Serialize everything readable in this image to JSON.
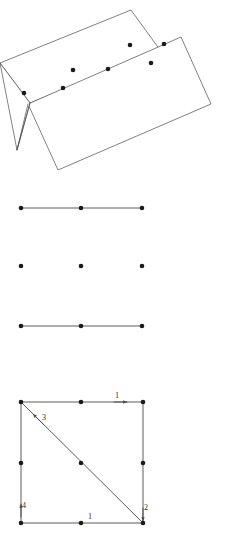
{
  "page": {
    "background_color": "#ffffff",
    "width": 228,
    "height": 551,
    "stroke_color": "#4a4a4a",
    "dot_color": "#1a1a1a",
    "label_color": "#2b2b2b"
  },
  "figures": [
    {
      "id": "folded-sheet-figure",
      "name": "folded-sheet-figure",
      "description": "Two overlapping tilted quadrilaterals forming a folded sheet, with seven marker dots",
      "polygons": [
        {
          "name": "upper-sheet-panel",
          "points": "0,63 131,10 160,50 30,103"
        },
        {
          "name": "lower-sheet-panel",
          "points": "28,104 181,37 211,104 58,170"
        },
        {
          "name": "fold-crease-panel",
          "points": "30,103 17,150 0,63"
        }
      ],
      "creases": [
        {
          "name": "fold-crease-left",
          "x1": 30,
          "y1": 103,
          "x2": 17,
          "y2": 150
        },
        {
          "name": "fold-crease-right",
          "x1": 17,
          "y1": 150,
          "x2": 28,
          "y2": 104
        }
      ],
      "dots": [
        {
          "name": "sheet-dot-1",
          "cx": 24,
          "cy": 93
        },
        {
          "name": "sheet-dot-2",
          "cx": 63,
          "cy": 88
        },
        {
          "name": "sheet-dot-3",
          "cx": 73,
          "cy": 70
        },
        {
          "name": "sheet-dot-4",
          "cx": 108,
          "cy": 69
        },
        {
          "name": "sheet-dot-5",
          "cx": 130,
          "cy": 45
        },
        {
          "name": "sheet-dot-6",
          "cx": 164,
          "cy": 44
        },
        {
          "name": "sheet-dot-7",
          "cx": 151,
          "cy": 63
        }
      ]
    },
    {
      "id": "dot-grid-figure",
      "name": "dot-grid-figure",
      "description": "Three-by-three grid of dots with horizontal connecting lines on the top and bottom rows only",
      "lines": [
        {
          "name": "grid-line-top",
          "x1": 21,
          "y1": 208,
          "x2": 142,
          "y2": 208
        },
        {
          "name": "grid-line-bottom",
          "x1": 21,
          "y1": 326,
          "x2": 142,
          "y2": 326
        }
      ],
      "dots": [
        {
          "name": "grid-dot-top-left",
          "cx": 21,
          "cy": 208
        },
        {
          "name": "grid-dot-top-center",
          "cx": 81,
          "cy": 208
        },
        {
          "name": "grid-dot-top-right",
          "cx": 142,
          "cy": 208
        },
        {
          "name": "grid-dot-middle-left",
          "cx": 21,
          "cy": 266
        },
        {
          "name": "grid-dot-middle-center",
          "cx": 81,
          "cy": 266
        },
        {
          "name": "grid-dot-middle-right",
          "cx": 142,
          "cy": 266
        },
        {
          "name": "grid-dot-bottom-left",
          "cx": 21,
          "cy": 326
        },
        {
          "name": "grid-dot-bottom-center",
          "cx": 81,
          "cy": 326
        },
        {
          "name": "grid-dot-bottom-right",
          "cx": 142,
          "cy": 326
        }
      ]
    },
    {
      "id": "numbered-square-figure",
      "name": "numbered-square-figure",
      "description": "Square with diagonal from top-left to bottom-right, nine dots, four numbered directed edges",
      "square": {
        "x1": 21,
        "y1": 402,
        "x2": 143,
        "y2": 523
      },
      "edges": [
        {
          "name": "square-edge-top",
          "x1": 21,
          "y1": 402,
          "x2": 143,
          "y2": 402
        },
        {
          "name": "square-edge-right",
          "x1": 143,
          "y1": 402,
          "x2": 143,
          "y2": 523
        },
        {
          "name": "square-edge-bottom",
          "x1": 21,
          "y1": 523,
          "x2": 143,
          "y2": 523
        },
        {
          "name": "square-edge-left",
          "x1": 21,
          "y1": 402,
          "x2": 21,
          "y2": 523
        },
        {
          "name": "square-diagonal",
          "x1": 21,
          "y1": 402,
          "x2": 143,
          "y2": 523
        }
      ],
      "dots": [
        {
          "name": "square-dot-top-left",
          "cx": 21,
          "cy": 402
        },
        {
          "name": "square-dot-top-center",
          "cx": 81,
          "cy": 402
        },
        {
          "name": "square-dot-top-right",
          "cx": 143,
          "cy": 402
        },
        {
          "name": "square-dot-left-middle",
          "cx": 21,
          "cy": 463
        },
        {
          "name": "square-dot-center",
          "cx": 81,
          "cy": 463
        },
        {
          "name": "square-dot-right-middle",
          "cx": 143,
          "cy": 463
        },
        {
          "name": "square-dot-bottom-left",
          "cx": 21,
          "cy": 523
        },
        {
          "name": "square-dot-bottom-center",
          "cx": 81,
          "cy": 523
        },
        {
          "name": "square-dot-bottom-right",
          "cx": 143,
          "cy": 523
        }
      ],
      "arrows": [
        {
          "name": "arrow-top-edge",
          "x1": 114,
          "y1": 402,
          "x2": 127,
          "y2": 402
        },
        {
          "name": "arrow-diagonal",
          "x1": 44,
          "y1": 425,
          "x2": 33,
          "y2": 414
        },
        {
          "name": "arrow-left-edge",
          "x1": 21,
          "y1": 517,
          "x2": 21,
          "y2": 504
        },
        {
          "name": "arrow-right-edge",
          "x1": 143,
          "y1": 508,
          "x2": 143,
          "y2": 521
        }
      ],
      "labels": [
        {
          "name": "edge-label-top",
          "text": "1",
          "x": 117,
          "y": 398
        },
        {
          "name": "edge-label-diagonal",
          "text": "3",
          "x": 44,
          "y": 420
        },
        {
          "name": "edge-label-left",
          "text": "4",
          "x": 24,
          "y": 508
        },
        {
          "name": "edge-label-right",
          "text": "2",
          "x": 146,
          "y": 510
        },
        {
          "name": "edge-label-bottom",
          "text": "1",
          "x": 90,
          "y": 519
        }
      ]
    }
  ]
}
